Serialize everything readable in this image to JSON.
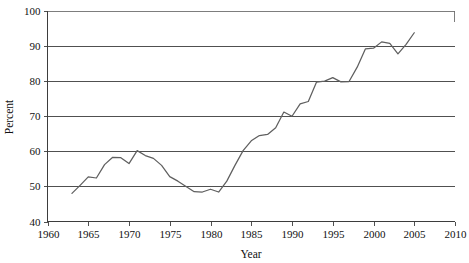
{
  "chart_data": {
    "type": "line",
    "title": "",
    "subtitle": "",
    "xlabel": "Year",
    "ylabel": "Percent",
    "xlim": [
      1960,
      2010
    ],
    "ylim": [
      40,
      100
    ],
    "xticks": [
      1960,
      1965,
      1970,
      1975,
      1980,
      1985,
      1990,
      1995,
      2000,
      2005,
      2010
    ],
    "yticks": [
      40,
      50,
      60,
      70,
      80,
      90,
      100
    ],
    "xtick_labels": [
      "1960",
      "1965",
      "1970",
      "1975",
      "1980",
      "1985",
      "1990",
      "1995",
      "2000",
      "2005",
      "2010"
    ],
    "ytick_labels": [
      "40",
      "50",
      "60",
      "70",
      "80",
      "90",
      "100"
    ],
    "grid": "horizontal",
    "legend": "none",
    "legend_position": "none",
    "line_color": "#5f5f5f",
    "axis_color": "#3d3d3d",
    "background_color": "#ffffff",
    "series": [
      {
        "name": "Percent",
        "x": [
          1963,
          1964,
          1965,
          1966,
          1967,
          1968,
          1969,
          1970,
          1971,
          1972,
          1973,
          1974,
          1975,
          1976,
          1977,
          1978,
          1979,
          1980,
          1981,
          1982,
          1983,
          1984,
          1985,
          1986,
          1987,
          1988,
          1989,
          1990,
          1991,
          1992,
          1993,
          1994,
          1995,
          1996,
          1997,
          1998,
          1999,
          2000,
          2001,
          2002,
          2003,
          2004,
          2005
        ],
        "values": [
          48.0,
          50.3,
          52.7,
          52.4,
          56.2,
          58.3,
          58.2,
          56.5,
          60.2,
          58.8,
          58.0,
          56.0,
          52.8,
          51.5,
          50.0,
          48.5,
          48.4,
          49.2,
          48.4,
          51.5,
          56.0,
          60.2,
          63.0,
          64.5,
          64.8,
          66.7,
          71.2,
          70.0,
          73.5,
          74.2,
          79.7,
          80.0,
          81.0,
          79.8,
          79.9,
          84.0,
          89.2,
          89.4,
          91.2,
          90.8,
          87.8,
          90.5,
          93.8
        ]
      }
    ]
  },
  "axes": {
    "y_axis_title": "Percent",
    "x_axis_title": "Year"
  }
}
